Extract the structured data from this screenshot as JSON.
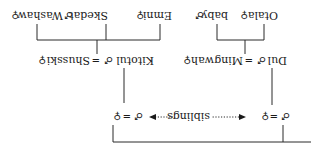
{
  "diagram": {
    "orientation": "rotated-180",
    "generation_1": {
      "left_couple": {
        "husband_symbol": "♂",
        "equals": "=",
        "wife_symbol": "♀"
      },
      "right_couple": {
        "husband_symbol": "♂",
        "equals": "=",
        "wife_symbol": "♀"
      },
      "relation_label": "siblings"
    },
    "generation_2": {
      "left_couple": {
        "husband": "Kitotul",
        "husband_symbol": "♂",
        "equals": "=",
        "wife": "Shusski",
        "wife_symbol": "♀"
      },
      "right_couple": {
        "husband": "Dul",
        "husband_symbol": "♂",
        "equals": "=",
        "wife": "Mingwah",
        "wife_symbol": "♀"
      }
    },
    "generation_3": {
      "left_children": [
        {
          "name": "Emni",
          "symbol": "♀"
        },
        {
          "name": "Skedat",
          "symbol": "♂"
        },
        {
          "name": "Washaw",
          "symbol": "♀"
        }
      ],
      "right_children": [
        {
          "name": "Otala",
          "symbol": "♀"
        },
        {
          "name": "baby",
          "symbol": "♂"
        }
      ]
    }
  }
}
